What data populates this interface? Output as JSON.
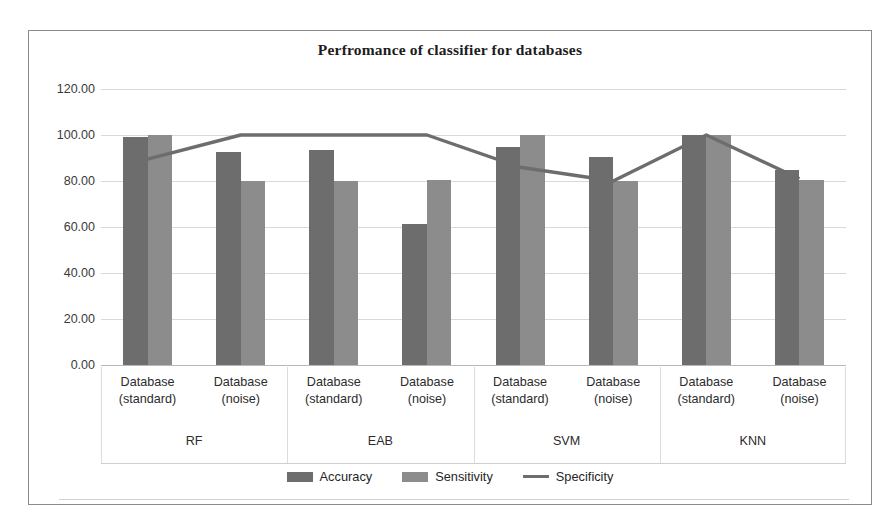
{
  "chart_data": {
    "type": "bar",
    "title": "Perfromance of classifier for databases",
    "xlabel": "",
    "ylabel": "",
    "ylim": [
      0,
      120
    ],
    "ytick_step": 20,
    "ytick_labels": [
      "120.00",
      "100.00",
      "80.00",
      "60.00",
      "40.00",
      "20.00",
      "0.00"
    ],
    "ytick_values": [
      120,
      100,
      80,
      60,
      40,
      20,
      0
    ],
    "grid": true,
    "legend_position": "bottom",
    "groups": [
      "RF",
      "EAB",
      "SVM",
      "KNN"
    ],
    "categories": [
      "Database (standard)",
      "Database (noise)",
      "Database (standard)",
      "Database (noise)",
      "Database (standard)",
      "Database (noise)",
      "Database (standard)",
      "Database (noise)"
    ],
    "category_lines": [
      [
        "Database",
        "(standard)"
      ],
      [
        "Database",
        "(noise)"
      ],
      [
        "Database",
        "(standard)"
      ],
      [
        "Database",
        "(noise)"
      ],
      [
        "Database",
        "(standard)"
      ],
      [
        "Database",
        "(noise)"
      ],
      [
        "Database",
        "(standard)"
      ],
      [
        "Database",
        "(noise)"
      ]
    ],
    "series": [
      {
        "name": "Accuracy",
        "kind": "bar",
        "color": "#6d6d6d",
        "values": [
          99.0,
          92.7,
          93.5,
          61.5,
          94.8,
          90.4,
          100.0,
          85.0
        ]
      },
      {
        "name": "Sensitivity",
        "kind": "bar",
        "color": "#8c8c8c",
        "values": [
          100.0,
          80.0,
          80.0,
          80.5,
          100.0,
          80.0,
          100.0,
          80.5
        ]
      },
      {
        "name": "Specificity",
        "kind": "line",
        "color": "#6d6d6d",
        "values": [
          89.5,
          100.0,
          100.0,
          100.0,
          86.0,
          80.0,
          100.0,
          81.0
        ]
      }
    ]
  },
  "legend": {
    "items": [
      {
        "label": "Accuracy",
        "marker": "bar-swatch-dark"
      },
      {
        "label": "Sensitivity",
        "marker": "bar-swatch-light"
      },
      {
        "label": "Specificity",
        "marker": "line-swatch"
      }
    ]
  }
}
